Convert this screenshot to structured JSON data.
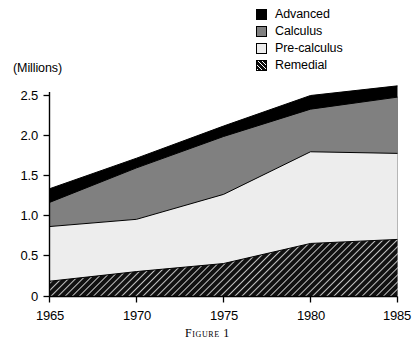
{
  "chart_data": {
    "type": "area",
    "stacked": true,
    "title": "",
    "caption": "Figure 1",
    "xlabel": "",
    "ylabel": "(Millions)",
    "x": [
      1965,
      1970,
      1975,
      1980,
      1985
    ],
    "xticklabels": [
      "1965",
      "1970",
      "1975",
      "1980",
      "1985"
    ],
    "xlim": [
      1965,
      1985
    ],
    "ylim": [
      0,
      2.75
    ],
    "yticks": [
      0,
      0.5,
      1.0,
      1.5,
      2.0,
      2.5
    ],
    "yticklabels": [
      "0",
      "0.5",
      "1.0",
      "1.5",
      "2.0",
      "2.5"
    ],
    "grid": false,
    "legend_position": "top-right",
    "stack_order_bottom_to_top": [
      "Remedial",
      "Pre-calculus",
      "Calculus",
      "Advanced"
    ],
    "series": [
      {
        "name": "Remedial",
        "fill": "hatch-diagonal",
        "color": "#111111",
        "values": [
          0.19,
          0.31,
          0.41,
          0.66,
          0.71
        ]
      },
      {
        "name": "Pre-calculus",
        "fill": "solid",
        "color": "#ededed",
        "values": [
          0.68,
          0.65,
          0.86,
          1.14,
          1.07
        ]
      },
      {
        "name": "Calculus",
        "fill": "solid",
        "color": "#808080",
        "values": [
          0.3,
          0.64,
          0.72,
          0.53,
          0.7
        ]
      },
      {
        "name": "Advanced",
        "fill": "solid",
        "color": "#000000",
        "values": [
          0.17,
          0.12,
          0.13,
          0.17,
          0.14
        ]
      }
    ],
    "cumulative_tops": {
      "Remedial": [
        0.19,
        0.31,
        0.41,
        0.66,
        0.71
      ],
      "Pre-calculus": [
        0.87,
        0.96,
        1.27,
        1.8,
        1.78
      ],
      "Calculus": [
        1.17,
        1.6,
        1.99,
        2.33,
        2.48
      ],
      "Advanced": [
        1.34,
        1.72,
        2.12,
        2.5,
        2.62
      ]
    }
  },
  "legend": {
    "items": [
      {
        "label": "Advanced",
        "swatch": "advanced-swatch"
      },
      {
        "label": "Calculus",
        "swatch": "calculus-swatch"
      },
      {
        "label": "Pre-calculus",
        "swatch": "precalculus-swatch"
      },
      {
        "label": "Remedial",
        "swatch": "remedial-swatch"
      }
    ]
  },
  "axes": {
    "units_label": "(Millions)",
    "y_tick_labels": [
      "2.5",
      "2.0",
      "1.5",
      "1.0",
      "0.5",
      "0"
    ],
    "x_tick_labels": [
      "1965",
      "1970",
      "1975",
      "1980",
      "1985"
    ]
  },
  "caption": {
    "text": "Figure 1"
  }
}
